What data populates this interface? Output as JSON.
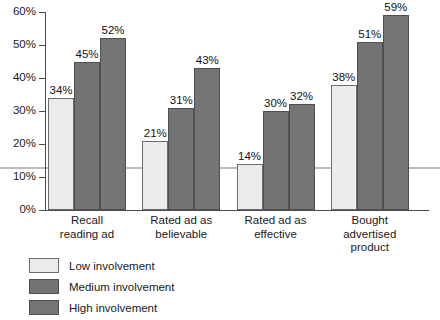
{
  "chart_data": {
    "type": "bar",
    "title": "",
    "subtitle": "",
    "xlabel": "",
    "ylabel": "",
    "ylim": [
      0,
      60
    ],
    "ytick_labels": [
      "0%",
      "10%",
      "20%",
      "30%",
      "40%",
      "50%",
      "60%"
    ],
    "ytick_values": [
      0,
      10,
      20,
      30,
      40,
      50,
      60
    ],
    "grid": false,
    "legend_position": "bottom-left",
    "categories": [
      "Recall\nreading ad",
      "Rated ad as\nbelievable",
      "Rated ad as\neffective",
      "Bought\nadvertised\nproduct"
    ],
    "series": [
      {
        "name": "Low involvement",
        "color": "#ebebeb",
        "values": [
          34,
          21,
          14,
          38
        ],
        "value_labels": [
          "34%",
          "21%",
          "14%",
          "38%"
        ]
      },
      {
        "name": "Medium involvement",
        "color": "#737373",
        "values": [
          45,
          31,
          30,
          51
        ],
        "value_labels": [
          "45%",
          "31%",
          "30%",
          "51%"
        ]
      },
      {
        "name": "High involvement",
        "color": "#757575",
        "values": [
          52,
          43,
          32,
          59
        ],
        "value_labels": [
          "52%",
          "43%",
          "32%",
          "59%"
        ]
      }
    ],
    "reference_line": {
      "value": 13,
      "color": "#bcbcbc"
    }
  },
  "legend": {
    "items": [
      {
        "label": "Low involvement",
        "swatch": "low"
      },
      {
        "label": "Medium involvement",
        "swatch": "medium"
      },
      {
        "label": "High involvement",
        "swatch": "high"
      }
    ]
  }
}
